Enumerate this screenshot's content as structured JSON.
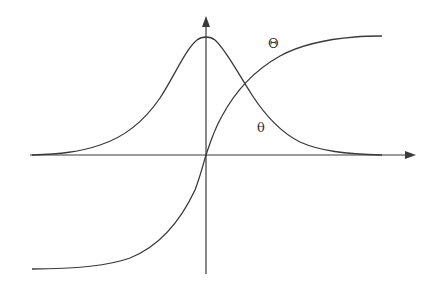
{
  "diagram": {
    "type": "function-plot",
    "axes": {
      "x_axis": {
        "direction": "right",
        "arrow": true
      },
      "y_axis": {
        "direction": "up",
        "arrow": true
      }
    },
    "curves": [
      {
        "name": "bell-curve",
        "label": "θ",
        "shape": "bell / derivative of sigmoid"
      },
      {
        "name": "sigmoid-curve",
        "label": "Θ",
        "shape": "sigmoid"
      }
    ],
    "labels": {
      "theta_upper": "Θ",
      "theta_lower": "θ"
    },
    "colors": {
      "line": "#3a3a3a",
      "background": "#ffffff"
    }
  }
}
